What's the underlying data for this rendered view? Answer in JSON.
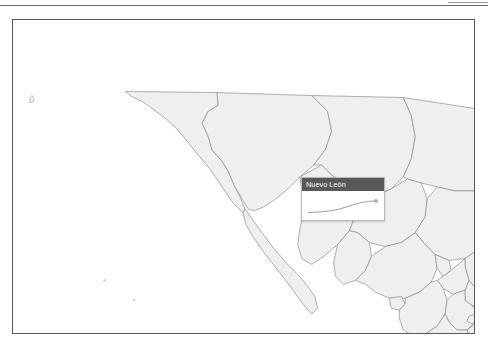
{
  "page": {
    "background_color": "#ffffff",
    "rule_color": "#6f6f6f"
  },
  "map": {
    "title": "Mexico states choropleth map",
    "frame_border_color": "#5a5a5a",
    "state_fill_color": "#efefef",
    "state_border_color": "#8d8d8d",
    "region": "Mexico",
    "states": [
      "Baja California",
      "Baja California Sur",
      "Sonora",
      "Chihuahua",
      "Coahuila",
      "Nuevo León",
      "Tamaulipas",
      "Sinaloa",
      "Durango",
      "Zacatecas",
      "San Luis Potosí",
      "Nayarit",
      "Jalisco",
      "Aguascalientes",
      "Guanajuato",
      "Querétaro",
      "Hidalgo",
      "Veracruz",
      "Colima",
      "Michoacán",
      "México",
      "Ciudad de México",
      "Morelos",
      "Tlaxcala",
      "Puebla",
      "Guerrero",
      "Oaxaca",
      "Chiapas",
      "Tabasco",
      "Campeche",
      "Yucatán",
      "Quintana Roo"
    ]
  },
  "tooltip": {
    "title": "Nuevo León",
    "header_color": "#58585a",
    "background_color": "#ffffff",
    "border_color": "#b9b9b9",
    "visible": true
  },
  "chart_data": {
    "type": "line",
    "title": "Nuevo León",
    "xlabel": "",
    "ylabel": "",
    "grid": false,
    "legend": false,
    "series": [
      {
        "name": "Nuevo León",
        "x": [
          0,
          1,
          2,
          3,
          4,
          5,
          6,
          7,
          8,
          9
        ],
        "values": [
          8,
          10,
          13,
          18,
          26,
          38,
          52,
          63,
          70,
          73
        ]
      }
    ],
    "marker_at_last_point": true,
    "line_color": "#9d9d9d",
    "marker_color": "#b5b5b5",
    "ylim": [
      0,
      100
    ],
    "xlim": [
      0,
      9
    ]
  }
}
